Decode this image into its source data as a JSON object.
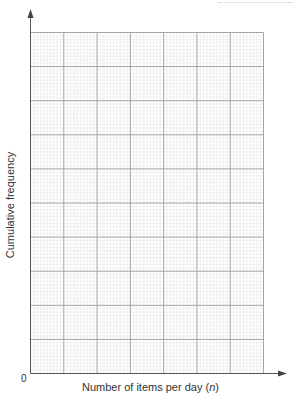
{
  "chart_data": {
    "type": "line",
    "title": "",
    "xlabel": "Number of items per day (n)",
    "xlabel_parts": {
      "prefix": "Number of items per day (",
      "variable": "n",
      "suffix": ")"
    },
    "ylabel": "Cumulative frequency",
    "origin_label": "0",
    "x_tick_labels": [],
    "y_tick_labels": [],
    "series": [],
    "grid": {
      "on": true,
      "major_columns": 7,
      "major_rows": 10,
      "minor_per_major": 10
    },
    "axis_arrows": true,
    "note": "Blank cumulative frequency graph grid; no data plotted"
  },
  "colors": {
    "axis": "#555555",
    "major_grid": "#9a9a9a",
    "minor_grid": "#e2e2e2",
    "text": "#333333"
  }
}
